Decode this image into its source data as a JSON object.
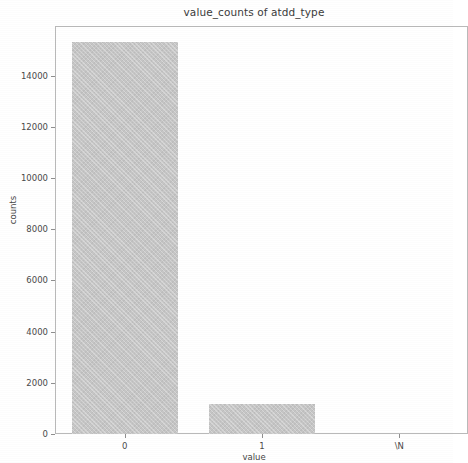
{
  "chart_data": {
    "type": "bar",
    "title": "value_counts of atdd_type",
    "xlabel": "value",
    "ylabel": "counts",
    "categories": [
      "0",
      "1",
      "\\N"
    ],
    "values": [
      15300,
      1170,
      0
    ],
    "ylim": [
      0,
      15900
    ],
    "yticks": [
      0,
      2000,
      4000,
      6000,
      8000,
      10000,
      12000,
      14000
    ],
    "ytick_labels": [
      "0",
      "2000",
      "4000",
      "6000",
      "8000",
      "10000",
      "12000",
      "14000"
    ],
    "xtick_labels": [
      "0",
      "1",
      "\\N"
    ],
    "grid": false,
    "legend": null,
    "bar_color": "#c6c6c6",
    "bar_edge_color": "#c6c6c6",
    "frame_color": "#b9b9b9",
    "background": "#ffffff",
    "text_color": "#3b3b3b"
  }
}
